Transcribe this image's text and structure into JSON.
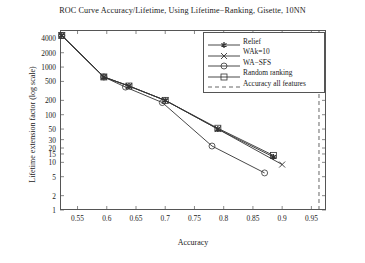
{
  "chart_data": {
    "type": "line",
    "title": "ROC Curve Accuracy/Lifetime,  Using Lifetime−Ranking,  Gisette,  10NN",
    "xlabel": "Accuracy",
    "ylabel": "Lifetime extension factor (log scale)",
    "xlim": [
      0.52,
      0.975
    ],
    "ylim": [
      1,
      6000
    ],
    "yscale": "log",
    "grid": false,
    "legend_position": "top-right",
    "xticks": [
      0.55,
      0.6,
      0.65,
      0.7,
      0.75,
      0.8,
      0.85,
      0.9,
      0.95
    ],
    "xticklabels": [
      "0.55",
      "0.6",
      "0.65",
      "0.7",
      "0.75",
      "0.8",
      "0.85",
      "0.9",
      "0.95"
    ],
    "yticks": [
      1,
      2,
      5,
      10,
      15,
      20,
      30,
      50,
      100,
      200,
      500,
      1000,
      2000,
      4000
    ],
    "yticklabels": [
      "1",
      "2",
      "5",
      "10",
      "15",
      "20",
      "30",
      "50",
      "100",
      "200",
      "500",
      "1000",
      "2000",
      "4000"
    ],
    "series": [
      {
        "name": "Relief",
        "marker": "star",
        "color": "#333333",
        "x": [
          0.523,
          0.595,
          0.638,
          0.7,
          0.79,
          0.885
        ],
        "y": [
          4600,
          620,
          400,
          200,
          50,
          13
        ]
      },
      {
        "name": "WAk=10",
        "marker": "x",
        "color": "#333333",
        "x": [
          0.523,
          0.595,
          0.638,
          0.7,
          0.79,
          0.9
        ],
        "y": [
          4600,
          620,
          400,
          200,
          50,
          9
        ]
      },
      {
        "name": "WA−SFS",
        "marker": "circle",
        "color": "#333333",
        "x": [
          0.523,
          0.595,
          0.632,
          0.695,
          0.78,
          0.87
        ],
        "y": [
          4600,
          620,
          380,
          180,
          22,
          6
        ]
      },
      {
        "name": "Random ranking",
        "marker": "square",
        "color": "#333333",
        "x": [
          0.523,
          0.595,
          0.638,
          0.7,
          0.79,
          0.885
        ],
        "y": [
          4600,
          620,
          400,
          200,
          52,
          14
        ]
      }
    ],
    "annotations": [
      {
        "name": "Accuracy all features",
        "type": "vline",
        "style": "dashed",
        "x": 0.963
      }
    ],
    "legend_entries": [
      {
        "label": "Relief",
        "marker": "star"
      },
      {
        "label": "WAk=10",
        "marker": "x"
      },
      {
        "label": "WA−SFS",
        "marker": "circle"
      },
      {
        "label": "Random ranking",
        "marker": "square"
      },
      {
        "label": "Accuracy all features",
        "marker": "dashed-line"
      }
    ]
  }
}
